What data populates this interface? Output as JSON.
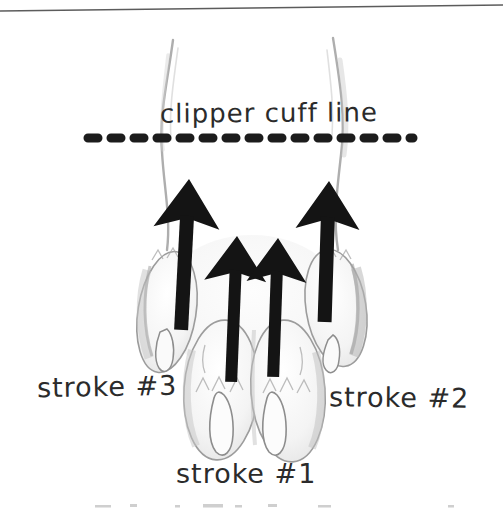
{
  "illustration": {
    "description": "dog paw grooming diagram",
    "clipper_cuff_line_label": "clipper cuff line",
    "labels": {
      "stroke1": "stroke #1",
      "stroke2": "stroke #2",
      "stroke3": "stroke #3"
    },
    "arrows": [
      {
        "name": "stroke-3-arrow",
        "direction": "up",
        "position": "outer-left"
      },
      {
        "name": "stroke-1-left-arrow",
        "direction": "up",
        "position": "center-left"
      },
      {
        "name": "stroke-1-right-arrow",
        "direction": "up",
        "position": "center-right"
      },
      {
        "name": "stroke-2-arrow",
        "direction": "up",
        "position": "outer-right"
      }
    ],
    "colors": {
      "arrow_ink": "#141414",
      "dash_line": "#1c1c1c",
      "label_text": "#2b2b2b",
      "pencil_outline": "#9c9c9c",
      "background": "#ffffff"
    }
  }
}
